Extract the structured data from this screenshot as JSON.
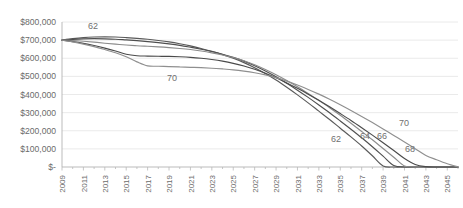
{
  "chart_data": {
    "type": "line",
    "title": "",
    "subtitle": "",
    "xlabel": "",
    "ylabel": "",
    "grid": "horizontal",
    "legend_position": "inline-annotations",
    "x": [
      2009,
      2010,
      2011,
      2012,
      2013,
      2014,
      2015,
      2016,
      2017,
      2018,
      2019,
      2020,
      2021,
      2022,
      2023,
      2024,
      2025,
      2026,
      2027,
      2028,
      2029,
      2030,
      2031,
      2032,
      2033,
      2034,
      2035,
      2036,
      2037,
      2038,
      2039,
      2040,
      2041,
      2042,
      2043,
      2044,
      2045,
      2046
    ],
    "xlim": [
      2009,
      2046
    ],
    "ylim": [
      0,
      800000
    ],
    "x_tick_labels": [
      "2009",
      "2011",
      "2013",
      "2015",
      "2017",
      "2019",
      "2021",
      "2023",
      "2025",
      "2027",
      "2029",
      "2031",
      "2033",
      "2035",
      "2037",
      "2039",
      "2041",
      "2043",
      "2045"
    ],
    "y_tick_labels": [
      "$800,000",
      "$700,000",
      "$600,000",
      "$500,000",
      "$400,000",
      "$300,000",
      "$200,000",
      "$100,000",
      "$-"
    ],
    "y_tick_values": [
      800000,
      700000,
      600000,
      500000,
      400000,
      300000,
      200000,
      100000,
      0
    ],
    "series": [
      {
        "name": "62",
        "label": "62",
        "color": "#5a5a5a",
        "values": [
          700000,
          708000,
          714000,
          717000,
          718000,
          717000,
          714000,
          710000,
          705000,
          698000,
          690000,
          680000,
          668000,
          654000,
          638000,
          620000,
          600000,
          576000,
          548000,
          516000,
          480000,
          440000,
          398000,
          354000,
          308000,
          262000,
          214000,
          166000,
          116000,
          62000,
          6000,
          0,
          0,
          0,
          0,
          0,
          0,
          0
        ]
      },
      {
        "name": "64",
        "label": "64",
        "color": "#4f4f4f",
        "values": [
          700000,
          704000,
          707000,
          708000,
          707000,
          705000,
          701000,
          697000,
          692000,
          686000,
          679000,
          671000,
          661000,
          650000,
          637000,
          622000,
          605000,
          584000,
          559000,
          530000,
          498000,
          462000,
          424000,
          384000,
          342000,
          299000,
          254000,
          208000,
          161000,
          112000,
          60000,
          8000,
          0,
          0,
          0,
          0,
          0,
          0
        ]
      },
      {
        "name": "66",
        "label": "66",
        "color": "#8c8c8c",
        "values": [
          700000,
          698000,
          694000,
          689000,
          683000,
          678000,
          673000,
          669000,
          666000,
          663000,
          659000,
          654000,
          648000,
          640000,
          630000,
          618000,
          604000,
          586000,
          564000,
          538000,
          509000,
          477000,
          443000,
          406000,
          367000,
          327000,
          285000,
          241000,
          196000,
          150000,
          102000,
          54000,
          6000,
          0,
          0,
          0,
          0,
          0
        ]
      },
      {
        "name": "68",
        "label": "68",
        "color": "#4a4a4a",
        "values": [
          700000,
          692000,
          682000,
          670000,
          656000,
          640000,
          622000,
          614000,
          612000,
          611000,
          610000,
          608000,
          605000,
          600000,
          593000,
          584000,
          572000,
          557000,
          539000,
          517000,
          492000,
          464000,
          434000,
          402000,
          368000,
          332000,
          295000,
          257000,
          217000,
          176000,
          134000,
          91000,
          47000,
          14000,
          2000,
          0,
          0,
          0
        ]
      },
      {
        "name": "70",
        "label": "70",
        "color": "#8f8f8f",
        "values": [
          700000,
          690000,
          678000,
          664000,
          648000,
          630000,
          608000,
          580000,
          558000,
          556000,
          554000,
          552000,
          550000,
          548000,
          545000,
          541000,
          536000,
          529000,
          520000,
          508000,
          493000,
          474000,
          452000,
          428000,
          402000,
          374000,
          344000,
          312000,
          279000,
          245000,
          210000,
          174000,
          138000,
          101000,
          64000,
          40000,
          18000,
          0
        ]
      }
    ],
    "annotations": [
      {
        "text": "62",
        "series": "62",
        "position": "upper-left"
      },
      {
        "text": "70",
        "series": "70",
        "position": "mid-left"
      },
      {
        "text": "62",
        "series": "62",
        "position": "lower-right"
      },
      {
        "text": "64",
        "series": "64",
        "position": "lower-right"
      },
      {
        "text": "66",
        "series": "66",
        "position": "lower-right"
      },
      {
        "text": "68",
        "series": "68",
        "position": "lower-right"
      },
      {
        "text": "70",
        "series": "70",
        "position": "lower-right"
      }
    ]
  }
}
